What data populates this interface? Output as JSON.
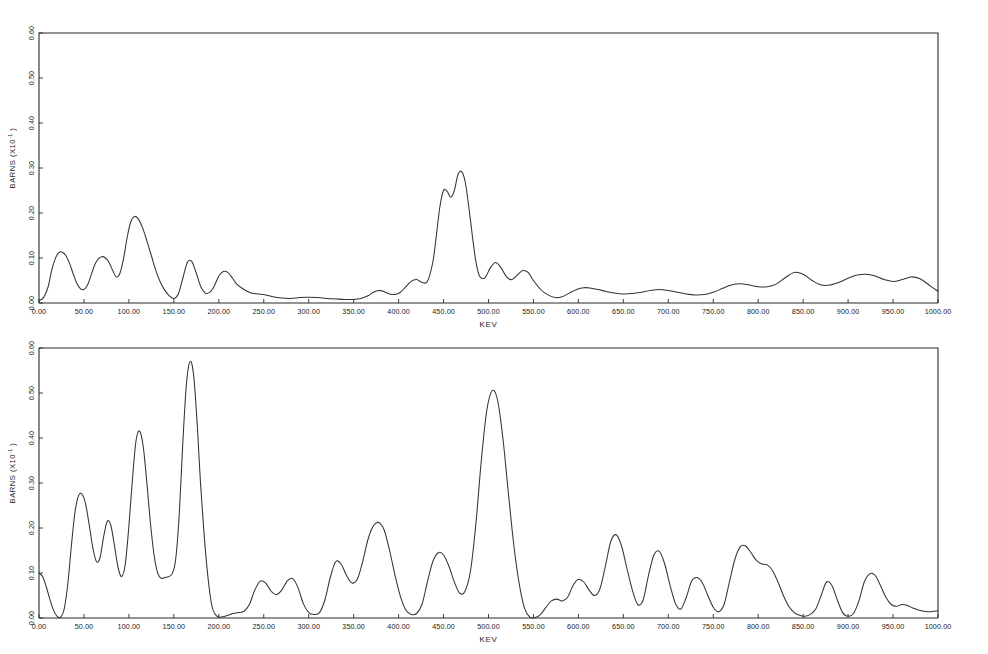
{
  "figure": {
    "background_color": "#ffffff",
    "curve_color": "#333333",
    "axis_color": "#2a2a2a"
  },
  "chart_data": [
    {
      "type": "line",
      "panel": "top",
      "title": "",
      "xlabel": "KEV",
      "ylabel": "BARNS (X10",
      "ylabel_exponent": "-1",
      "ylabel_suffix": ")",
      "xlim": [
        0,
        1000
      ],
      "ylim": [
        0,
        0.6
      ],
      "grid": false,
      "legend": null,
      "xticks": [
        0,
        50,
        100,
        150,
        200,
        250,
        300,
        350,
        400,
        450,
        500,
        550,
        600,
        650,
        700,
        750,
        800,
        850,
        900,
        950,
        1000
      ],
      "xtick_labels": [
        "0.00",
        "50.00",
        "100.00",
        "150.00",
        "200.00",
        "250.00",
        "300.00",
        "350.00",
        "400.00",
        "450.00",
        "500.00",
        "550.00",
        "600.00",
        "650.00",
        "700.00",
        "750.00",
        "800.00",
        "850.00",
        "900.00",
        "950.00",
        "1000.00"
      ],
      "yticks": [
        0.0,
        0.1,
        0.2,
        0.3,
        0.4,
        0.5,
        0.6
      ],
      "ytick_labels": [
        "0.00",
        "0.10",
        "0.20",
        "0.30",
        "0.40",
        "0.50",
        "0.60"
      ],
      "x": [
        0,
        5,
        10,
        14,
        18,
        22,
        26,
        30,
        34,
        38,
        42,
        46,
        50,
        54,
        58,
        62,
        66,
        70,
        74,
        78,
        82,
        86,
        90,
        94,
        98,
        102,
        106,
        110,
        115,
        120,
        125,
        130,
        135,
        140,
        145,
        150,
        155,
        160,
        165,
        170,
        175,
        180,
        185,
        190,
        195,
        200,
        205,
        210,
        215,
        220,
        228,
        236,
        244,
        252,
        260,
        270,
        280,
        290,
        300,
        310,
        320,
        330,
        340,
        350,
        358,
        366,
        372,
        378,
        384,
        390,
        396,
        402,
        408,
        414,
        420,
        426,
        432,
        438,
        442,
        446,
        450,
        454,
        458,
        462,
        466,
        470,
        474,
        478,
        482,
        486,
        490,
        496,
        502,
        508,
        514,
        520,
        526,
        532,
        538,
        544,
        550,
        558,
        566,
        574,
        582,
        590,
        598,
        606,
        614,
        622,
        630,
        640,
        650,
        660,
        670,
        680,
        690,
        700,
        710,
        720,
        730,
        740,
        750,
        760,
        770,
        780,
        790,
        800,
        810,
        820,
        830,
        840,
        850,
        860,
        870,
        880,
        890,
        900,
        910,
        920,
        930,
        940,
        950,
        960,
        970,
        980,
        990,
        1000
      ],
      "y": [
        0.005,
        0.012,
        0.035,
        0.072,
        0.098,
        0.112,
        0.113,
        0.105,
        0.088,
        0.065,
        0.044,
        0.032,
        0.03,
        0.04,
        0.062,
        0.085,
        0.098,
        0.103,
        0.1,
        0.09,
        0.072,
        0.058,
        0.066,
        0.098,
        0.145,
        0.18,
        0.192,
        0.188,
        0.168,
        0.138,
        0.105,
        0.072,
        0.046,
        0.028,
        0.016,
        0.01,
        0.02,
        0.055,
        0.09,
        0.092,
        0.066,
        0.036,
        0.022,
        0.024,
        0.038,
        0.06,
        0.07,
        0.068,
        0.056,
        0.042,
        0.03,
        0.022,
        0.02,
        0.018,
        0.014,
        0.011,
        0.01,
        0.012,
        0.013,
        0.012,
        0.01,
        0.009,
        0.008,
        0.008,
        0.01,
        0.016,
        0.024,
        0.028,
        0.025,
        0.02,
        0.019,
        0.024,
        0.036,
        0.048,
        0.052,
        0.046,
        0.048,
        0.09,
        0.15,
        0.215,
        0.25,
        0.248,
        0.235,
        0.25,
        0.285,
        0.292,
        0.27,
        0.215,
        0.15,
        0.092,
        0.06,
        0.056,
        0.078,
        0.09,
        0.078,
        0.058,
        0.052,
        0.062,
        0.072,
        0.068,
        0.05,
        0.03,
        0.018,
        0.012,
        0.014,
        0.022,
        0.03,
        0.034,
        0.033,
        0.03,
        0.026,
        0.022,
        0.02,
        0.021,
        0.024,
        0.028,
        0.03,
        0.028,
        0.024,
        0.02,
        0.018,
        0.019,
        0.024,
        0.032,
        0.04,
        0.043,
        0.04,
        0.036,
        0.036,
        0.042,
        0.056,
        0.068,
        0.064,
        0.05,
        0.04,
        0.04,
        0.046,
        0.055,
        0.062,
        0.064,
        0.06,
        0.052,
        0.048,
        0.052,
        0.058,
        0.054,
        0.04,
        0.026,
        0.015,
        0.009,
        0.006,
        0.005
      ]
    },
    {
      "type": "line",
      "panel": "bottom",
      "title": "",
      "xlabel": "KEV",
      "ylabel": "BARNS (X10",
      "ylabel_exponent": "-1",
      "ylabel_suffix": ")",
      "xlim": [
        0,
        1000
      ],
      "ylim": [
        0,
        0.6
      ],
      "grid": false,
      "legend": null,
      "xticks": [
        0,
        50,
        100,
        150,
        200,
        250,
        300,
        350,
        400,
        450,
        500,
        550,
        600,
        650,
        700,
        750,
        800,
        850,
        900,
        950,
        1000
      ],
      "xtick_labels": [
        "0.00",
        "50.00",
        "100.00",
        "150.00",
        "200.00",
        "250.00",
        "300.00",
        "350.00",
        "400.00",
        "450.00",
        "500.00",
        "550.00",
        "600.00",
        "650.00",
        "700.00",
        "750.00",
        "800.00",
        "850.00",
        "900.00",
        "950.00",
        "1000.00"
      ],
      "yticks": [
        0.0,
        0.1,
        0.2,
        0.3,
        0.4,
        0.5,
        0.6
      ],
      "ytick_labels": [
        "0.00",
        "0.10",
        "0.20",
        "0.30",
        "0.40",
        "0.50",
        "0.60"
      ],
      "x": [
        0,
        4,
        8,
        12,
        16,
        20,
        24,
        28,
        32,
        36,
        40,
        44,
        48,
        52,
        56,
        60,
        64,
        68,
        72,
        76,
        80,
        84,
        88,
        92,
        96,
        100,
        104,
        108,
        112,
        116,
        120,
        124,
        128,
        132,
        136,
        140,
        144,
        148,
        152,
        156,
        160,
        164,
        168,
        172,
        176,
        180,
        186,
        192,
        198,
        204,
        210,
        216,
        222,
        228,
        234,
        240,
        246,
        252,
        258,
        264,
        270,
        276,
        282,
        288,
        294,
        300,
        306,
        312,
        318,
        324,
        330,
        336,
        342,
        348,
        354,
        360,
        366,
        372,
        378,
        384,
        390,
        396,
        402,
        408,
        414,
        420,
        426,
        432,
        438,
        444,
        450,
        456,
        462,
        468,
        474,
        480,
        486,
        492,
        498,
        504,
        510,
        516,
        522,
        528,
        534,
        540,
        546,
        552,
        558,
        564,
        570,
        576,
        582,
        588,
        594,
        600,
        606,
        612,
        618,
        624,
        630,
        636,
        642,
        648,
        654,
        660,
        666,
        672,
        678,
        684,
        690,
        696,
        702,
        708,
        714,
        720,
        726,
        732,
        738,
        744,
        750,
        756,
        762,
        768,
        774,
        780,
        786,
        792,
        798,
        804,
        810,
        816,
        822,
        828,
        834,
        840,
        846,
        852,
        858,
        864,
        870,
        876,
        882,
        888,
        894,
        900,
        906,
        912,
        918,
        924,
        930,
        936,
        942,
        948,
        954,
        960,
        966,
        972,
        978,
        984,
        990,
        1000
      ],
      "y": [
        0.1,
        0.092,
        0.07,
        0.042,
        0.018,
        0.004,
        0.002,
        0.02,
        0.075,
        0.16,
        0.235,
        0.272,
        0.275,
        0.252,
        0.205,
        0.155,
        0.125,
        0.135,
        0.182,
        0.215,
        0.205,
        0.16,
        0.112,
        0.092,
        0.12,
        0.205,
        0.31,
        0.395,
        0.415,
        0.38,
        0.3,
        0.21,
        0.14,
        0.1,
        0.088,
        0.09,
        0.092,
        0.098,
        0.13,
        0.23,
        0.39,
        0.52,
        0.57,
        0.54,
        0.43,
        0.29,
        0.13,
        0.03,
        0.004,
        0.003,
        0.006,
        0.01,
        0.012,
        0.015,
        0.03,
        0.062,
        0.082,
        0.078,
        0.06,
        0.052,
        0.062,
        0.082,
        0.088,
        0.068,
        0.032,
        0.012,
        0.008,
        0.012,
        0.04,
        0.09,
        0.125,
        0.12,
        0.095,
        0.078,
        0.086,
        0.125,
        0.175,
        0.205,
        0.212,
        0.195,
        0.15,
        0.095,
        0.048,
        0.018,
        0.008,
        0.01,
        0.03,
        0.08,
        0.125,
        0.145,
        0.14,
        0.115,
        0.08,
        0.055,
        0.06,
        0.105,
        0.21,
        0.35,
        0.46,
        0.505,
        0.485,
        0.4,
        0.28,
        0.165,
        0.078,
        0.022,
        0.002,
        0.001,
        0.008,
        0.024,
        0.038,
        0.042,
        0.038,
        0.046,
        0.072,
        0.086,
        0.08,
        0.062,
        0.05,
        0.065,
        0.115,
        0.17,
        0.185,
        0.16,
        0.11,
        0.062,
        0.03,
        0.04,
        0.095,
        0.14,
        0.148,
        0.12,
        0.072,
        0.032,
        0.02,
        0.046,
        0.082,
        0.09,
        0.078,
        0.05,
        0.024,
        0.014,
        0.03,
        0.08,
        0.13,
        0.158,
        0.16,
        0.145,
        0.128,
        0.12,
        0.118,
        0.105,
        0.08,
        0.05,
        0.026,
        0.012,
        0.006,
        0.004,
        0.008,
        0.02,
        0.05,
        0.08,
        0.072,
        0.04,
        0.012,
        0.004,
        0.01,
        0.038,
        0.08,
        0.098,
        0.095,
        0.072,
        0.046,
        0.03,
        0.026,
        0.03,
        0.028,
        0.022,
        0.018,
        0.015,
        0.014,
        0.016,
        0.018,
        0.018,
        0.016,
        0.014,
        0.012
      ]
    }
  ]
}
